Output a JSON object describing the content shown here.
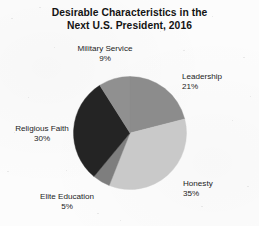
{
  "chart_data": {
    "type": "pie",
    "title": "Desirable Characteristics in the Next U.S. President, 2016",
    "title_line1": "Desirable Characteristics in the",
    "title_line2": "Next U.S. President, 2016",
    "xlabel": "",
    "ylabel": "",
    "grid": false,
    "legend": "none",
    "labels_position": "outside",
    "start_angle_deg": 0,
    "direction": "clockwise",
    "categories": [
      "Leadership",
      "Honesty",
      "Elite Education",
      "Religious Faith",
      "Military Service"
    ],
    "values": [
      21,
      35,
      5,
      30,
      9
    ],
    "units": "percent",
    "total": 100,
    "colors": [
      "#8c8c8c",
      "#c9c9c9",
      "#7e7e7e",
      "#242424",
      "#909090"
    ],
    "slices": [
      {
        "label": "Leadership",
        "value": 21,
        "value_text": "21%",
        "color": "#8c8c8c"
      },
      {
        "label": "Honesty",
        "value": 35,
        "value_text": "35%",
        "color": "#c9c9c9"
      },
      {
        "label": "Elite Education",
        "value": 5,
        "value_text": "5%",
        "color": "#7e7e7e"
      },
      {
        "label": "Religious Faith",
        "value": 30,
        "value_text": "30%",
        "color": "#242424"
      },
      {
        "label": "Military Service",
        "value": 9,
        "value_text": "9%",
        "color": "#909090"
      }
    ]
  },
  "background_color": "#fcfcfc",
  "text_color": "#1a1a1a"
}
